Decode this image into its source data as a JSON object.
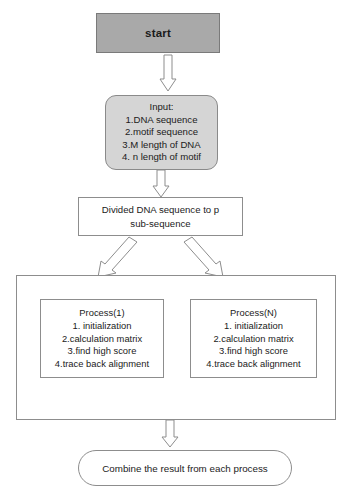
{
  "diagram": {
    "background_color": "#ffffff",
    "outline_color": "#8d8d8d",
    "start_fill": "#a9a9a9",
    "input_fill": "#d5d5d5"
  },
  "nodes": {
    "start": {
      "label": "start"
    },
    "input": {
      "heading": "Input:",
      "items": [
        "1.DNA sequence",
        "2.motif sequence",
        "3.M length of DNA",
        "4. n length of motif"
      ]
    },
    "divide": {
      "line1": "Divided DNA sequence to p",
      "line2": "sub-sequence"
    },
    "process_1": {
      "heading": "Process(1)",
      "items": [
        "1. initialization",
        "2.calculation matrix",
        "3.find high score",
        "4.trace back alignment"
      ]
    },
    "process_n": {
      "heading": "Process(N)",
      "items": [
        "1. initialization",
        "2.calculation matrix",
        "3.find high score",
        "4.trace back alignment"
      ]
    },
    "combine": {
      "label": "Combine the result from each process"
    }
  },
  "connectors": {
    "start_to_input": "down-block-arrow",
    "input_to_divide": "down-block-arrow",
    "divide_to_process_1": "diagonal-block-arrow-left",
    "divide_to_process_n": "diagonal-block-arrow-right",
    "container_to_combine": "down-block-arrow"
  }
}
